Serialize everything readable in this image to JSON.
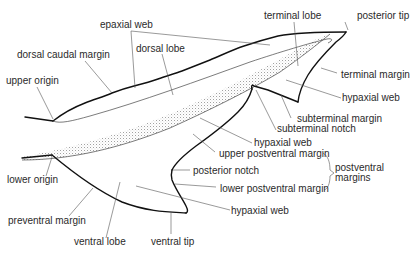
{
  "diagram": {
    "labels": {
      "epaxial_web": "epaxial web",
      "terminal_lobe": "terminal lobe",
      "posterior_tip": "posterior tip",
      "dorsal_caudal_margin": "dorsal caudal margin",
      "dorsal_lobe": "dorsal lobe",
      "upper_origin": "upper origin",
      "terminal_margin": "terminal margin",
      "hypaxial_web_upper": "hypaxial web",
      "subterminal_margin": "subterminal margin",
      "subterminal_notch": "subterminal notch",
      "hypaxial_web_middle": "hypaxial web",
      "upper_postventral_margin": "upper postventral margin",
      "postventral_margins_line1": "postventral",
      "postventral_margins_line2": "margins",
      "lower_origin": "lower origin",
      "posterior_notch": "posterior notch",
      "lower_postventral_margin": "lower postventral margin",
      "preventral_margin": "preventral margin",
      "hypaxial_web_lower": "hypaxial web",
      "ventral_lobe": "ventral lobe",
      "ventral_tip": "ventral tip"
    },
    "colors": {
      "outline": "#111111",
      "text": "#2a2a2a",
      "leader": "#555555",
      "stipple": "#9a9a9a"
    }
  }
}
